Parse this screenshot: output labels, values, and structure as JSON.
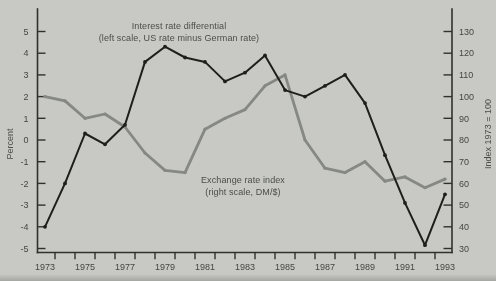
{
  "annotations": {
    "interest_line1": "Interest rate differential",
    "interest_line2": "(left scale, US rate minus German rate)",
    "exchange_line1": "Exchange rate index",
    "exchange_line2": "(right scale, DM/$)"
  },
  "chart_data": {
    "type": "line",
    "x": [
      1973,
      1974,
      1975,
      1976,
      1977,
      1978,
      1979,
      1980,
      1981,
      1982,
      1983,
      1984,
      1985,
      1986,
      1987,
      1988,
      1989,
      1990,
      1991,
      1992,
      1993
    ],
    "x_tick_labels": [
      "1973",
      "1975",
      "1977",
      "1979",
      "1981",
      "1983",
      "1985",
      "1987",
      "1989",
      "1991",
      "1993"
    ],
    "left_axis": {
      "label": "Percent",
      "range": [
        -5,
        5
      ],
      "ticks": [
        5,
        4,
        3,
        2,
        1,
        0,
        -1,
        -2,
        -3,
        -4,
        -5
      ]
    },
    "right_axis": {
      "label": "Index 1973 = 100",
      "range": [
        30,
        130
      ],
      "ticks": [
        130,
        120,
        110,
        100,
        90,
        80,
        70,
        60,
        50,
        40,
        30
      ]
    },
    "series": [
      {
        "id": "interest-rate-differential",
        "name": "Interest rate differential (left scale, US rate minus German rate)",
        "axis": "left",
        "color": "#1e1e1c",
        "values": [
          -4.0,
          -2.0,
          0.3,
          -0.2,
          0.7,
          3.6,
          4.3,
          3.8,
          3.6,
          2.7,
          3.1,
          3.9,
          2.3,
          2.0,
          2.5,
          3.0,
          1.7,
          -0.7,
          -2.9,
          -4.85,
          -2.5
        ]
      },
      {
        "id": "exchange-rate-index",
        "name": "Exchange rate index (right scale, DM/$)",
        "axis": "right",
        "color": "#868884",
        "values": [
          100,
          98,
          90,
          92,
          86,
          74,
          66,
          65,
          85,
          90,
          94,
          105,
          110,
          80,
          67,
          65,
          70,
          61,
          63,
          58,
          62
        ]
      }
    ],
    "colors": {
      "background": "#c8c9c5",
      "axis": "#30302c",
      "text": "#454640"
    },
    "legend_position": "none",
    "grid": false
  }
}
